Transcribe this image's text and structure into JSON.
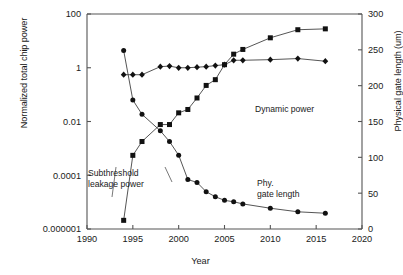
{
  "chart_data": {
    "type": "line",
    "title": "",
    "xlabel": "Year",
    "ylabel": "Normalized total chip power",
    "ylabel_right": "Physical gate length (um)",
    "xlim": [
      1990,
      2020
    ],
    "ylim": [
      1e-06,
      100
    ],
    "yscale": "log",
    "ylim_right": [
      0,
      300
    ],
    "yscale_right": "linear",
    "grid": false,
    "legend_position": "inline-annotations",
    "xticks": [
      "1990",
      "1995",
      "2000",
      "2005",
      "2010",
      "2015",
      "2020"
    ],
    "yticks_left": [
      "100",
      "1",
      "0.01",
      "0.0001",
      "0.000001"
    ],
    "yticks_right": [
      "300",
      "250",
      "200",
      "150",
      "100",
      "50",
      "0"
    ],
    "series": [
      {
        "name": "Dynamic power",
        "marker": "diamond",
        "axis": "left",
        "x": [
          1994,
          1995,
          1996,
          1998,
          1999,
          2000,
          2001,
          2002,
          2003,
          2004,
          2005,
          2006,
          2007,
          2010,
          2013,
          2016
        ],
        "values": [
          0.55,
          0.55,
          0.55,
          1.1,
          1.15,
          1.0,
          1.0,
          1.05,
          1.1,
          1.2,
          1.3,
          1.9,
          1.9,
          2.0,
          2.2,
          1.75
        ]
      },
      {
        "name": "Subthreshold leakage power",
        "marker": "square",
        "axis": "left",
        "x": [
          1994,
          1995,
          1996,
          1998,
          1999,
          2000,
          2001,
          2002,
          2003,
          2004,
          2005,
          2006,
          2007,
          2010,
          2013,
          2016
        ],
        "values": [
          2.1e-06,
          0.00055,
          0.0018,
          0.0077,
          0.0077,
          0.021,
          0.028,
          0.075,
          0.22,
          0.36,
          1.3,
          3.2,
          4.8,
          13.0,
          26.0,
          28.0
        ]
      },
      {
        "name": "Phy. gate length",
        "marker": "circle",
        "axis": "right",
        "x": [
          1994,
          1995,
          1996,
          1998,
          1999,
          2000,
          2001,
          2002,
          2003,
          2004,
          2005,
          2006,
          2007,
          2010,
          2013,
          2016
        ],
        "values": [
          249,
          180,
          160,
          137,
          122,
          103,
          69,
          65,
          52,
          45,
          40,
          38,
          35,
          29,
          24,
          22
        ]
      }
    ],
    "annotations": [
      {
        "id": "dynamic",
        "lines": [
          "Dynamic power"
        ]
      },
      {
        "id": "subthreshold",
        "lines": [
          "Subthreshold",
          "leakage power"
        ]
      },
      {
        "id": "phygate",
        "lines": [
          "Phy.",
          "gate length"
        ]
      }
    ]
  },
  "axes": {
    "x_title": "Year",
    "y_left_title": "Normalized total chip power",
    "y_right_title": "Physical gate length (um)"
  },
  "colors": {
    "marker": "#111111",
    "line": "#2a2a2a",
    "axis": "#555555",
    "background": "#ffffff"
  }
}
